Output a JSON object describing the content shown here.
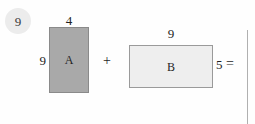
{
  "diagram": {
    "step_badge": {
      "label": "9"
    },
    "background_color": "#fefefe",
    "shapes": [
      {
        "id": "rect-a",
        "label": "A",
        "fill_color": "#a9a9a9",
        "border_color": "#8a8a8a",
        "width_label": "4",
        "height_label": "9"
      },
      {
        "id": "rect-b",
        "label": "B",
        "fill_color": "#eeeeee",
        "border_color": "#9a9a9a",
        "width_label": "9",
        "height_label": "5"
      }
    ],
    "operators": {
      "plus": "+",
      "equals": "="
    }
  }
}
